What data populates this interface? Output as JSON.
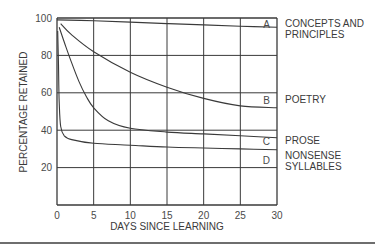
{
  "chart_data": {
    "type": "line",
    "title": "",
    "xlabel": "DAYS SINCE LEARNING",
    "ylabel": "PERCENTAGE RETAINED",
    "xlim": [
      0,
      30
    ],
    "ylim": [
      0,
      100
    ],
    "x_ticks": [
      0,
      5,
      10,
      15,
      20,
      25,
      30
    ],
    "y_ticks": [
      20,
      40,
      60,
      80,
      100
    ],
    "grid": true,
    "legend_position": "right (inline labels at line ends)",
    "series": [
      {
        "letter": "A",
        "name": "CONCEPTS AND PRINCIPLES",
        "name_lines": [
          "CONCEPTS AND",
          "PRINCIPLES"
        ],
        "x": [
          0,
          5,
          10,
          15,
          20,
          25,
          30
        ],
        "values": [
          99,
          98.5,
          97.8,
          97,
          96.3,
          95.6,
          95
        ]
      },
      {
        "letter": "B",
        "name": "POETRY",
        "name_lines": [
          "POETRY"
        ],
        "x": [
          0.5,
          2,
          5,
          10,
          15,
          20,
          25,
          30
        ],
        "values": [
          97,
          91,
          82,
          71,
          63,
          57,
          53,
          52
        ]
      },
      {
        "letter": "C",
        "name": "PROSE",
        "name_lines": [
          "PROSE"
        ],
        "x": [
          0.3,
          1,
          2,
          3,
          4,
          5,
          7,
          10,
          15,
          20,
          25,
          30
        ],
        "values": [
          95,
          87,
          76,
          66,
          58,
          52,
          45,
          41,
          39,
          38,
          37,
          36
        ]
      },
      {
        "letter": "D",
        "name": "NONSENSE SYLLABLES",
        "name_lines": [
          "NONSENSE",
          "SYLLABLES"
        ],
        "x": [
          0.1,
          0.2,
          0.3,
          0.5,
          1,
          2,
          5,
          10,
          15,
          20,
          25,
          30
        ],
        "values": [
          93,
          75,
          55,
          42,
          37,
          35,
          33,
          32,
          31,
          30.5,
          30,
          29.5
        ]
      }
    ]
  },
  "labels": {
    "xlabel": "DAYS SINCE LEARNING",
    "ylabel": "PERCENTAGE RETAINED"
  },
  "colors": {
    "line": "#3a3a3a",
    "grid": "#3a3a3a",
    "text": "#3a3a3a"
  }
}
